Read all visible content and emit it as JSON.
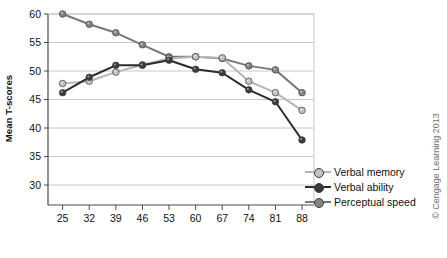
{
  "chart_data": {
    "type": "line",
    "title": "",
    "xlabel": "Age",
    "ylabel": "Mean T-scores",
    "categories": [
      25,
      32,
      39,
      46,
      53,
      60,
      67,
      74,
      81,
      88
    ],
    "xtick_labels": [
      "25",
      "32",
      "39",
      "46",
      "53",
      "60",
      "67",
      "74",
      "81",
      "88"
    ],
    "ytick_labels": [
      "30",
      "35",
      "40",
      "45",
      "50",
      "55",
      "60"
    ],
    "yticks": [
      30,
      35,
      40,
      45,
      50,
      55,
      60
    ],
    "ylim": [
      26.5,
      60
    ],
    "grid": "horizontal",
    "legend_position": "right-bottom",
    "series": [
      {
        "name": "Verbal memory",
        "color": "#b6b6b6",
        "marker_color": "#c2c2c2",
        "values": [
          47.8,
          48.2,
          49.8,
          51.1,
          52.2,
          52.5,
          52.3,
          48.2,
          46.2,
          43.1
        ]
      },
      {
        "name": "Verbal ability",
        "color": "#2b2b2b",
        "marker_color": "#3a3a3a",
        "values": [
          46.2,
          48.9,
          51.0,
          51.0,
          51.9,
          50.3,
          49.7,
          46.7,
          44.6,
          37.9
        ]
      },
      {
        "name": "Perceptual speed",
        "color": "#787878",
        "marker_color": "#848484",
        "values": [
          60.0,
          58.2,
          56.7,
          54.6,
          52.5,
          52.5,
          52.2,
          50.9,
          50.2,
          46.2
        ]
      }
    ]
  },
  "legend": {
    "items": [
      {
        "label": "Verbal memory"
      },
      {
        "label": "Verbal ability"
      },
      {
        "label": "Perceptual speed"
      }
    ]
  },
  "credit": {
    "text": "© Cengage Learning 2013"
  },
  "colors": {
    "axis": "#4a4a4a",
    "grid": "#c8c8c8",
    "text": "#111111",
    "credit": "#6f6f6f"
  }
}
